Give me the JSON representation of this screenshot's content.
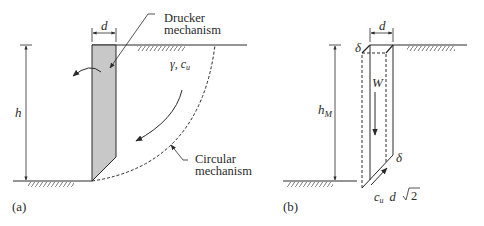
{
  "panel_a": {
    "caption": "(a)",
    "dimension_width": "d",
    "dimension_height": "h",
    "soil_params_gamma": "γ",
    "soil_params_sep": ",",
    "soil_params_c": "c",
    "soil_params_c_sub": "u",
    "label_drucker_line1": "Drucker",
    "label_drucker_line2": "mechanism",
    "label_circular_line1": "Circular",
    "label_circular_line2": "mechanism"
  },
  "panel_b": {
    "caption": "(b)",
    "dimension_width": "d",
    "dimension_height": "h",
    "dimension_height_sub": "M",
    "weight_label": "W",
    "displacement_top": "δ",
    "displacement_bottom": "δ",
    "shear_c": "c",
    "shear_c_sub": "u",
    "shear_length": "d",
    "shear_root": "2"
  },
  "colors": {
    "line": "#2a2a2a",
    "wall_fill": "#c8c8c8",
    "hatch": "#555555"
  }
}
